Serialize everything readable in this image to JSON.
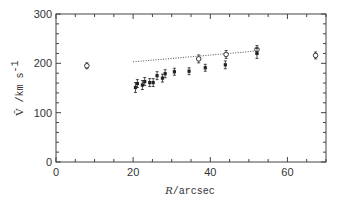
{
  "chart_data": {
    "type": "scatter",
    "title": "",
    "xlabel": "R/arcsec",
    "xlabel_parts": {
      "var": "R",
      "rest": "/arcsec"
    },
    "ylabel": "V̄ /km s⁻¹",
    "ylabel_parts": {
      "var": "V̄",
      "rest": " /km s",
      "sup": "-1"
    },
    "xlim": [
      0,
      70
    ],
    "ylim": [
      0,
      300
    ],
    "xticks": [
      0,
      20,
      40,
      60
    ],
    "yticks": [
      0,
      100,
      200,
      300
    ],
    "x_minor_step": 5,
    "y_minor_step": 20,
    "grid": false,
    "legend": null,
    "series": [
      {
        "name": "open-circles",
        "marker": "open-circle",
        "points": [
          {
            "x": 8.0,
            "y": 195,
            "err": 3
          },
          {
            "x": 37.0,
            "y": 209,
            "err": 5
          },
          {
            "x": 44.1,
            "y": 218,
            "err": 5
          },
          {
            "x": 52.1,
            "y": 228,
            "err": 5
          },
          {
            "x": 67.3,
            "y": 216,
            "err": 4
          }
        ]
      },
      {
        "name": "filled-squares",
        "marker": "filled-square",
        "points": [
          {
            "x": 20.6,
            "y": 151,
            "err": 7
          },
          {
            "x": 21.1,
            "y": 159,
            "err": 5
          },
          {
            "x": 22.4,
            "y": 156,
            "err": 6
          },
          {
            "x": 23.0,
            "y": 163,
            "err": 5
          },
          {
            "x": 24.3,
            "y": 161,
            "err": 5
          },
          {
            "x": 25.2,
            "y": 161,
            "err": 5
          },
          {
            "x": 26.2,
            "y": 175,
            "err": 5
          },
          {
            "x": 27.6,
            "y": 170,
            "err": 5
          },
          {
            "x": 28.3,
            "y": 179,
            "err": 5
          },
          {
            "x": 30.7,
            "y": 183,
            "err": 4
          },
          {
            "x": 34.5,
            "y": 184,
            "err": 4
          },
          {
            "x": 38.7,
            "y": 191,
            "err": 4
          },
          {
            "x": 43.9,
            "y": 197,
            "err": 5
          },
          {
            "x": 52.1,
            "y": 220,
            "err": 7
          }
        ]
      }
    ],
    "lines": [
      {
        "name": "dotted-fit",
        "style": "dotted",
        "x": [
          20,
          52
        ],
        "y": [
          203,
          225
        ]
      }
    ]
  },
  "colors": {
    "axis": "#444444",
    "marker": "#222222",
    "text": "#333333",
    "background": "#ffffff"
  }
}
